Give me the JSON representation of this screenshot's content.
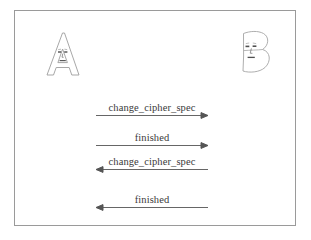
{
  "figure": {
    "frame_color": "#9a9a9a",
    "background_color": "#ffffff",
    "text_color": "#3a3a3a",
    "arrow_color": "#555555"
  },
  "parties": [
    {
      "id": "party-a",
      "letter": "A",
      "label": "A",
      "side": "left",
      "style": "outline-letter-with-face"
    },
    {
      "id": "party-b",
      "letter": "B",
      "label": "B",
      "side": "right",
      "style": "outline-letter-with-face"
    }
  ],
  "messages": [
    {
      "index": 1,
      "label": "change_cipher_spec",
      "direction": "right",
      "from": "A",
      "to": "B"
    },
    {
      "index": 2,
      "label": "finished",
      "direction": "right",
      "from": "A",
      "to": "B"
    },
    {
      "index": 3,
      "label": "change_cipher_spec",
      "direction": "left",
      "from": "B",
      "to": "A"
    },
    {
      "index": 4,
      "label": "finished",
      "direction": "left",
      "from": "B",
      "to": "A"
    }
  ]
}
